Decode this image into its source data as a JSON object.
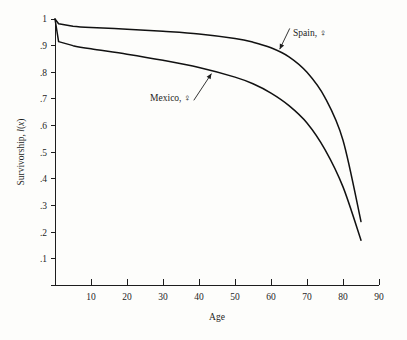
{
  "chart_data": {
    "type": "line",
    "title": "",
    "subtitle": "",
    "xlabel": "Age",
    "ylabel": "Survivorship, l(x)",
    "xlim": [
      0,
      90
    ],
    "ylim": [
      0,
      1
    ],
    "grid": false,
    "legend_position": "inline-annotations",
    "x_ticks": [
      0,
      10,
      20,
      30,
      40,
      50,
      60,
      70,
      80,
      90
    ],
    "x_tick_labels": [
      "",
      "10",
      "20",
      "30",
      "40",
      "50",
      "60",
      "70",
      "80",
      "90"
    ],
    "y_ticks": [
      0,
      0.1,
      0.2,
      0.3,
      0.4,
      0.5,
      0.6,
      0.7,
      0.8,
      0.9,
      1.0
    ],
    "y_tick_labels": [
      "",
      ".1",
      ".2",
      ".3",
      ".4",
      ".5",
      ".6",
      ".7",
      ".8",
      ".9",
      "1"
    ],
    "series": [
      {
        "name": "Spain, ♀",
        "label": "Spain, ♀",
        "x": [
          0,
          1,
          5,
          10,
          20,
          30,
          40,
          50,
          55,
          60,
          65,
          70,
          75,
          80,
          85
        ],
        "values": [
          1.0,
          0.982,
          0.973,
          0.968,
          0.962,
          0.954,
          0.944,
          0.927,
          0.913,
          0.892,
          0.858,
          0.8,
          0.705,
          0.545,
          0.24
        ]
      },
      {
        "name": "Mexico, ♀",
        "label": "Mexico, ♀",
        "x": [
          0,
          1,
          5,
          10,
          20,
          30,
          40,
          50,
          55,
          60,
          65,
          70,
          75,
          80,
          85
        ],
        "values": [
          1.0,
          0.915,
          0.9,
          0.888,
          0.868,
          0.845,
          0.818,
          0.782,
          0.757,
          0.722,
          0.675,
          0.61,
          0.51,
          0.37,
          0.17
        ]
      }
    ],
    "annotations": [
      {
        "text": "Spain, ♀",
        "anchor_x": 62,
        "anchor_y": 0.875,
        "label_x": 288,
        "label_y": 32
      },
      {
        "text": "Mexico, ♀",
        "anchor_x": 44,
        "anchor_y": 0.806,
        "label_x": 196,
        "label_y": 97
      }
    ]
  },
  "axis": {
    "x_title": "Age",
    "y_title_parts": {
      "main": "Survivorship, ",
      "italic_l": "l",
      "paren_open": "(",
      "italic_x": "x",
      "paren_close": ")"
    }
  }
}
